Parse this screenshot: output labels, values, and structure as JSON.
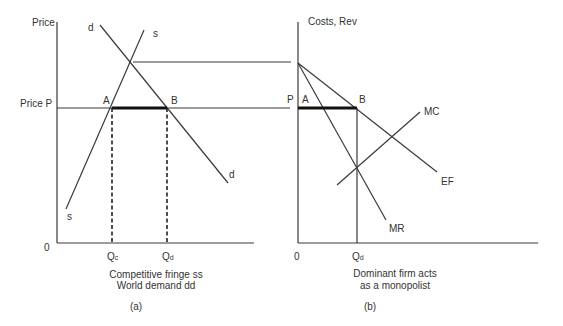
{
  "panel_a": {
    "y_axis_label": "Price",
    "price_label": "Price P",
    "origin_label": "0",
    "curve_d_top": "d",
    "curve_d_bottom": "d",
    "curve_s_top": "s",
    "curve_s_bottom": "s",
    "point_a": "A",
    "point_b": "B",
    "qc_label": "Q",
    "qc_sub": "c",
    "qd_label": "Q",
    "qd_sub": "d",
    "caption_line1": "Competitive fringe ss",
    "caption_line2": "World demand dd",
    "panel_tag": "(a)"
  },
  "panel_b": {
    "y_axis_label": "Costs, Rev",
    "price_label": "P",
    "origin_label": "0",
    "point_a": "A",
    "point_b": "B",
    "mc_label": "MC",
    "ef_label": "EF",
    "mr_label": "MR",
    "qd_label": "Q",
    "qd_sub": "d",
    "caption_line1": "Dominant firm acts",
    "caption_line2": "as a monopolist",
    "panel_tag": "(b)"
  },
  "colors": {
    "line": "#3a3a3a",
    "thick": "#111111",
    "text": "#333333"
  }
}
